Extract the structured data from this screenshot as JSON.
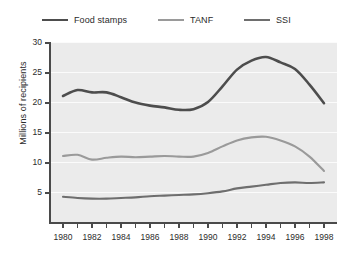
{
  "chart_data": {
    "type": "line",
    "title": "",
    "xlabel": "",
    "ylabel": "Millions of recipients",
    "xlim": [
      1980,
      1998
    ],
    "ylim": [
      0,
      30
    ],
    "grid": true,
    "legend_position": "top",
    "x": [
      1980,
      1981,
      1982,
      1983,
      1984,
      1985,
      1986,
      1987,
      1988,
      1989,
      1990,
      1991,
      1992,
      1993,
      1994,
      1995,
      1996,
      1997,
      1998
    ],
    "xtick_labels": [
      "1980",
      "1982",
      "1984",
      "1986",
      "1988",
      "1990",
      "1992",
      "1994",
      "1996",
      "1998"
    ],
    "xtick_values": [
      1980,
      1982,
      1984,
      1986,
      1988,
      1990,
      1992,
      1994,
      1996,
      1998
    ],
    "xminor_ticks": [
      1980,
      1981,
      1982,
      1983,
      1984,
      1985,
      1986,
      1987,
      1988,
      1989,
      1990,
      1991,
      1992,
      1993,
      1994,
      1995,
      1996,
      1997,
      1998
    ],
    "ytick_labels": [
      "5",
      "10",
      "15",
      "20",
      "25",
      "30"
    ],
    "ytick_values": [
      5,
      10,
      15,
      20,
      25,
      30
    ],
    "series": [
      {
        "name": "Food stamps",
        "color": "#4d4d4d",
        "width": 2.6,
        "values": [
          21.0,
          22.0,
          21.6,
          21.6,
          20.8,
          19.9,
          19.4,
          19.1,
          18.7,
          18.8,
          20.0,
          22.6,
          25.4,
          26.9,
          27.5,
          26.6,
          25.5,
          22.9,
          19.8
        ]
      },
      {
        "name": "TANF",
        "color": "#9a9a9a",
        "width": 2.1,
        "values": [
          11.0,
          11.2,
          10.4,
          10.7,
          10.9,
          10.8,
          10.9,
          11.0,
          10.9,
          10.9,
          11.5,
          12.6,
          13.6,
          14.1,
          14.2,
          13.6,
          12.6,
          10.9,
          8.5
        ]
      },
      {
        "name": "SSI",
        "color": "#6e6e6e",
        "width": 2.1,
        "values": [
          4.2,
          4.0,
          3.9,
          3.9,
          4.0,
          4.1,
          4.3,
          4.4,
          4.5,
          4.6,
          4.8,
          5.1,
          5.6,
          5.9,
          6.2,
          6.5,
          6.6,
          6.5,
          6.6
        ]
      }
    ]
  },
  "legend": {
    "items": [
      {
        "label": "Food stamps"
      },
      {
        "label": "TANF"
      },
      {
        "label": "SSI"
      }
    ]
  },
  "axes": {
    "y_title": "Millions of recipients"
  },
  "colors": {
    "plot_background": "#ebebeb",
    "figure_background": "#ffffff",
    "gridline": "#fbfbfb",
    "axis": "#4a4a4a",
    "text": "#2b2b2b"
  }
}
